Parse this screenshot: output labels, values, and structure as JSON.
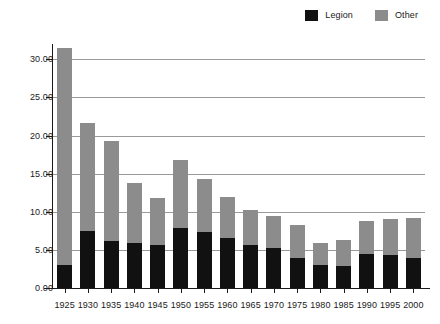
{
  "legend": {
    "position": "top-right",
    "items": [
      {
        "label": "Legion",
        "color": "#111111",
        "icon": "legend-swatch-icon"
      },
      {
        "label": "Other",
        "color": "#8c8c8c",
        "icon": "legend-swatch-icon"
      }
    ]
  },
  "axes": {
    "y_ticks": [
      "0.00",
      "5.00",
      "10.00",
      "15.00",
      "20.00",
      "25.00",
      "30.00"
    ],
    "y_tick_values": [
      0,
      5,
      10,
      15,
      20,
      25,
      30
    ],
    "x_ticks": [
      "1925",
      "1930",
      "1935",
      "1940",
      "1945",
      "1950",
      "1955",
      "1960",
      "1965",
      "1970",
      "1975",
      "1980",
      "1985",
      "1990",
      "1995",
      "2000"
    ]
  },
  "colors": {
    "legion": "#111111",
    "other": "#8c8c8c",
    "grid": "#9a9a9a",
    "axis": "#1a1a1a",
    "background": "#ffffff"
  },
  "chart_data": {
    "type": "bar",
    "stacked": true,
    "title": "",
    "subtitle": "",
    "xlabel": "",
    "ylabel": "",
    "ylim": [
      0,
      32
    ],
    "grid": true,
    "legend_position": "top-right",
    "categories": [
      "1925",
      "1930",
      "1935",
      "1940",
      "1945",
      "1950",
      "1955",
      "1960",
      "1965",
      "1970",
      "1975",
      "1980",
      "1985",
      "1990",
      "1995",
      "2000"
    ],
    "series": [
      {
        "name": "Legion",
        "color": "#111111",
        "values": [
          3.0,
          7.5,
          6.2,
          5.9,
          5.7,
          7.9,
          7.4,
          6.5,
          5.7,
          5.3,
          3.9,
          3.0,
          2.9,
          4.4,
          4.3,
          4.0
        ]
      },
      {
        "name": "Other",
        "color": "#8c8c8c",
        "values": [
          28.5,
          14.1,
          13.1,
          7.9,
          6.1,
          8.9,
          6.9,
          5.4,
          4.5,
          4.1,
          4.4,
          2.9,
          3.4,
          4.4,
          4.7,
          5.2
        ]
      }
    ],
    "totals": [
      31.5,
      21.6,
      19.3,
      13.8,
      11.8,
      16.8,
      14.3,
      11.9,
      10.2,
      9.4,
      8.3,
      5.9,
      6.3,
      8.8,
      9.0,
      9.2
    ]
  }
}
